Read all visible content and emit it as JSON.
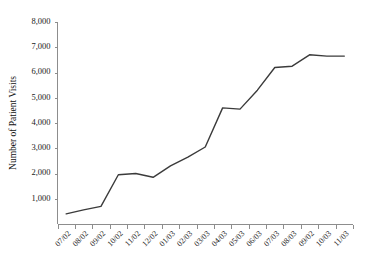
{
  "chart_data": {
    "type": "line",
    "title": "",
    "subtitle": "",
    "xlabel": "",
    "ylabel": "Number of Patient Visits",
    "categories": [
      "07/02",
      "08/02",
      "09/02",
      "10/02",
      "11/02",
      "12/02",
      "01/03",
      "02/03",
      "03/03",
      "04/03",
      "05/03",
      "06/03",
      "07/03",
      "08/03",
      "09/02",
      "10/03",
      "11/03"
    ],
    "values": [
      400,
      560,
      700,
      1950,
      2000,
      1850,
      2300,
      2650,
      3050,
      4600,
      4550,
      5300,
      6200,
      6250,
      6700,
      6650,
      6650
    ],
    "series": [
      {
        "name": "Patient Visits",
        "values": [
          400,
          560,
          700,
          1950,
          2000,
          1850,
          2300,
          2650,
          3050,
          4600,
          4550,
          5300,
          6200,
          6250,
          6700,
          6650,
          6650
        ]
      }
    ],
    "ylim": [
      0,
      8000
    ],
    "ytick_labels": [
      "8,000",
      "7,000",
      "6,000",
      "5,000",
      "4,000",
      "3,000",
      "2,000",
      "1,000",
      "-"
    ],
    "ytick_values": [
      8000,
      7000,
      6000,
      5000,
      4000,
      3000,
      2000,
      1000,
      0
    ],
    "grid": false,
    "legend": false,
    "legend_position": "none",
    "line_color": "#3b3b3b",
    "axis_color": "#8d8d8d",
    "text_color": "#1a1a1a",
    "background_color": "#ffffff",
    "xtick_rotation_deg": 45
  }
}
